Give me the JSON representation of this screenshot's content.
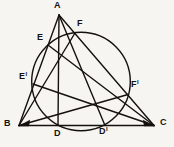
{
  "figure": {
    "type": "geometry-diagram",
    "colors": {
      "ink": "#14110e",
      "background": "#f6f5f1"
    },
    "geometry": {
      "vertices": [
        "A",
        "B",
        "C"
      ],
      "sides": [
        "AB",
        "BC",
        "CA"
      ],
      "circle_points": [
        "E",
        "E'",
        "D",
        "D'",
        "F",
        "F'"
      ],
      "circle_intersections": {
        "AB": [
          "E",
          "E'"
        ],
        "BC": [
          "D",
          "D'"
        ],
        "CA": [
          "F",
          "F'"
        ]
      },
      "cevians": [
        "AD",
        "AD'",
        "BF",
        "BF'",
        "CE",
        "CE'"
      ]
    }
  },
  "labels": {
    "A": {
      "base": "A",
      "prime": ""
    },
    "B": {
      "base": "B",
      "prime": ""
    },
    "C": {
      "base": "C",
      "prime": ""
    },
    "D": {
      "base": "D",
      "prime": ""
    },
    "D1": {
      "base": "D",
      "prime": "l"
    },
    "E": {
      "base": "E",
      "prime": ""
    },
    "E1": {
      "base": "E",
      "prime": "l"
    },
    "F": {
      "base": "F",
      "prime": ""
    },
    "F1": {
      "base": "F",
      "prime": "l"
    }
  }
}
